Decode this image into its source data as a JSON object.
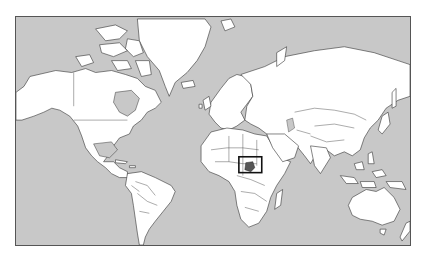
{
  "map": {
    "type": "political world map",
    "projection": "Mercator",
    "colors": {
      "ocean": "#c8c8c8",
      "land": "#ffffff",
      "borders": "#333333",
      "highlight_fill": "#555555",
      "highlight_box": "#111111",
      "frame": "#555555"
    },
    "highlight": {
      "country": "Uganda",
      "region": "East Africa",
      "locator_box": true
    }
  }
}
